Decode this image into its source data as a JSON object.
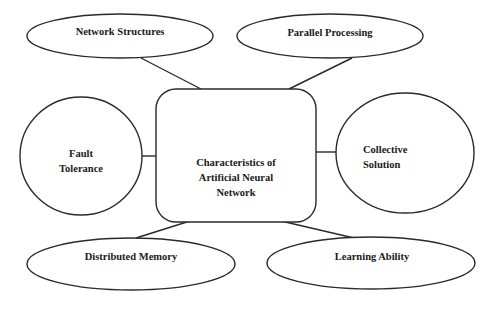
{
  "diagram": {
    "title": "Characteristics of Artificial Neural Network",
    "center": {
      "lines": [
        "Characteristics of",
        "Artificial Neural",
        "Network"
      ]
    },
    "nodes": [
      {
        "id": "network-structures",
        "label": "Network Structures",
        "shape": "ellipse"
      },
      {
        "id": "parallel-processing",
        "label": "Parallel Processing",
        "shape": "ellipse"
      },
      {
        "id": "fault-tolerance",
        "lines": [
          "Fault",
          "Tolerance"
        ],
        "shape": "circle"
      },
      {
        "id": "collective-solution",
        "lines": [
          "Collective",
          "Solution"
        ],
        "shape": "ellipse"
      },
      {
        "id": "distributed-memory",
        "label": "Distributed Memory",
        "shape": "ellipse"
      },
      {
        "id": "learning-ability",
        "label": "Learning Ability",
        "shape": "ellipse"
      }
    ],
    "colors": {
      "stroke": "#2a2a2a",
      "background": "#ffffff",
      "text": "#1a1a1a"
    }
  }
}
